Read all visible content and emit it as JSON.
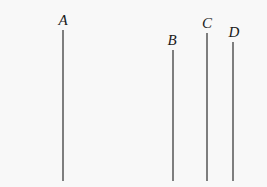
{
  "figure": {
    "background_color": "#f8f8f8",
    "width": 267,
    "height": 187,
    "line_color": "#565656",
    "line_width": 1.5,
    "label_color": "#1a1a1a"
  },
  "chart_data": {
    "type": "line",
    "title": "",
    "subtitle": "",
    "xlabel": "",
    "ylabel": "",
    "grid": false,
    "legend": "none",
    "xlim": [
      0,
      267
    ],
    "ylim": [
      187,
      0
    ],
    "groups": [
      {
        "name": "left-group",
        "members": [
          "A"
        ]
      },
      {
        "name": "right-group",
        "members": [
          "B",
          "C",
          "D"
        ]
      }
    ],
    "baseline_y": 181,
    "segments": [
      {
        "label": "A",
        "x": 63,
        "y_top": 30,
        "y_bottom": 181,
        "length": 151,
        "label_x": 63,
        "label_y": 13,
        "group": "left-group"
      },
      {
        "label": "B",
        "x": 173,
        "y_top": 50,
        "y_bottom": 181,
        "length": 131,
        "label_x": 172,
        "label_y": 33,
        "group": "right-group"
      },
      {
        "label": "C",
        "x": 207,
        "y_top": 33,
        "y_bottom": 181,
        "length": 148,
        "label_x": 207,
        "label_y": 16,
        "group": "right-group"
      },
      {
        "label": "D",
        "x": 233,
        "y_top": 42,
        "y_bottom": 181,
        "length": 139,
        "label_x": 234,
        "label_y": 25,
        "group": "right-group"
      }
    ]
  }
}
